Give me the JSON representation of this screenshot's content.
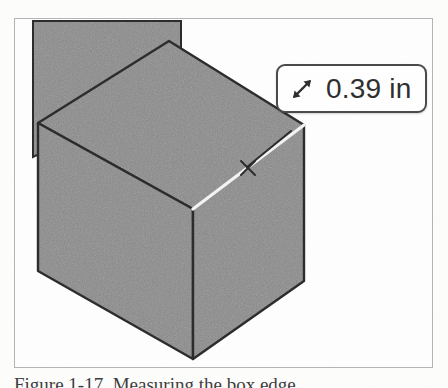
{
  "figure": {
    "caption": "Figure 1-17. Measuring the box edge",
    "frame_border_color": "#b4b4b2",
    "background_color": "#fefefe"
  },
  "viewport": {
    "name": "3d-model-viewport",
    "solid_fill_color": "#8a8a8a",
    "edge_color": "#2b2b2b",
    "highlight_edge_color": "#f2f2f2",
    "shapes": [
      {
        "name": "background-wall",
        "label": "background solid"
      },
      {
        "name": "cube-top-face",
        "label": "top face"
      },
      {
        "name": "cube-left-face",
        "label": "left face"
      },
      {
        "name": "cube-right-face",
        "label": "right face"
      },
      {
        "name": "selected-edge",
        "label": "highlighted measured edge"
      },
      {
        "name": "snap-point-marker",
        "label": "midpoint snap marker"
      }
    ]
  },
  "measurement_badge": {
    "icon": "double-headed-diagonal-arrow-icon",
    "value": "0.39 in",
    "border_color": "#4a4a4a",
    "background_color": "#ffffff",
    "text_color": "#2e2e2e"
  }
}
